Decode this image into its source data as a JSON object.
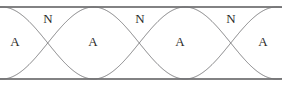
{
  "figure": {
    "type": "standing-wave-diagram",
    "width": 282,
    "height": 87,
    "background_color": "#ffffff",
    "line_color": "#58585a",
    "curve_color": "#6f6f72",
    "text_color": "#2b2b2b"
  },
  "boundaries": {
    "top_line": {
      "y": 7,
      "x_start": 0,
      "x_end": 282
    },
    "bottom_line": {
      "y": 79,
      "x_start": 0,
      "x_end": 282
    }
  },
  "wave": {
    "axis_y": 43,
    "amplitude": 36,
    "node_positions_x": [
      48,
      140,
      231
    ],
    "antinode_positions_x": [
      2,
      94,
      185,
      277
    ],
    "half_wavelength_px": 91.5,
    "phase_start": "antinode"
  },
  "labels": {
    "nodes": [
      {
        "text": "N",
        "x": 48,
        "y": 18
      },
      {
        "text": "N",
        "x": 140,
        "y": 18
      },
      {
        "text": "N",
        "x": 231,
        "y": 18
      }
    ],
    "antinodes": [
      {
        "text": "A",
        "x": 15,
        "y": 41
      },
      {
        "text": "A",
        "x": 93,
        "y": 41
      },
      {
        "text": "A",
        "x": 180,
        "y": 41
      },
      {
        "text": "A",
        "x": 263,
        "y": 41
      }
    ]
  },
  "legend": {
    "node_symbol": "N",
    "antinode_symbol": "A"
  }
}
